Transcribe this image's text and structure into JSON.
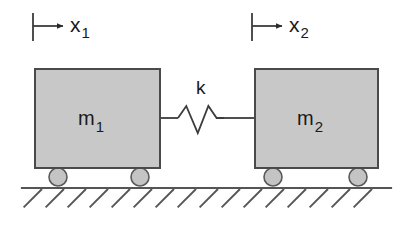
{
  "diagram": {
    "background_color": "#ffffff",
    "line_color": "#3c3c3c",
    "block_fill_color": "#c8c8c8",
    "block_stroke_color": "#4a4a4a",
    "wheel_fill_color": "#c4c4c4",
    "wheel_stroke_color": "#5a5a5a",
    "ground_color": "#555555"
  },
  "displacements": [
    {
      "name": "x1",
      "base": "x",
      "subscript": "1",
      "arrow_direction": "right",
      "tick_x": 33,
      "tick_y_top": 13,
      "tick_y_bottom": 41,
      "arrow_y": 26,
      "arrow_x_end": 63,
      "label_x": 70,
      "label_y": 14
    },
    {
      "name": "x2",
      "base": "x",
      "subscript": "2",
      "arrow_direction": "right",
      "tick_x": 252,
      "tick_y_top": 13,
      "tick_y_bottom": 41,
      "arrow_y": 26,
      "arrow_x_end": 282,
      "label_x": 289,
      "label_y": 14
    }
  ],
  "masses": [
    {
      "name": "m1",
      "base": "m",
      "subscript": "1",
      "x": 35,
      "y": 69,
      "width": 125,
      "height": 99,
      "label_x": 78,
      "label_y": 108
    },
    {
      "name": "m2",
      "base": "m",
      "subscript": "2",
      "x": 255,
      "y": 69,
      "width": 123,
      "height": 99,
      "label_x": 297,
      "label_y": 108
    }
  ],
  "spring": {
    "name": "k",
    "label": "k",
    "label_x": 196,
    "label_y": 78,
    "lead_y": 118,
    "left_lead_start_x": 160,
    "left_lead_end_x": 178,
    "right_lead_start_x": 224,
    "right_lead_end_x": 255,
    "peak_y": 106,
    "valley_y": 133,
    "path": "M 178,118 L 186,106 L 196,133 L 207,106 L 216,118"
  },
  "wheels": [
    {
      "name": "wheel-m1-left",
      "cx": 58,
      "cy": 177,
      "r": 9
    },
    {
      "name": "wheel-m1-right",
      "cx": 140,
      "cy": 177,
      "r": 9
    },
    {
      "name": "wheel-m2-left",
      "cx": 273,
      "cy": 177,
      "r": 9
    },
    {
      "name": "wheel-m2-right",
      "cx": 358,
      "cy": 177,
      "r": 9
    }
  ],
  "ground": {
    "line_y": 188,
    "line_x_start": 22,
    "line_x_end": 391,
    "hatch_count": 16,
    "hatch_spacing": 22,
    "hatch_length": 26,
    "hatch_angle_deg": 45,
    "hatch_first_x": 42
  }
}
